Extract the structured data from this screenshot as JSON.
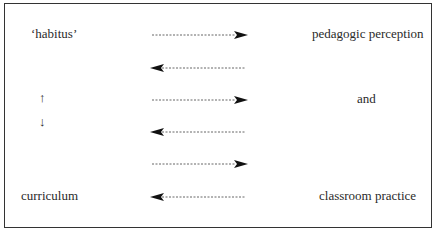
{
  "diagram": {
    "left_labels": {
      "top": "‘habitus’",
      "bottom": "curriculum",
      "up_arrow": "↑",
      "down_arrow": "↓"
    },
    "right_labels": {
      "top": "pedagogic perception",
      "middle": "and",
      "bottom": "classroom practice"
    },
    "arrows": [
      {
        "direction": "right",
        "style": "dashed"
      },
      {
        "direction": "left",
        "style": "dashed"
      },
      {
        "direction": "right",
        "style": "dashed"
      },
      {
        "direction": "left",
        "style": "dashed"
      },
      {
        "direction": "right",
        "style": "dashed"
      },
      {
        "direction": "left",
        "style": "dashed"
      }
    ]
  }
}
